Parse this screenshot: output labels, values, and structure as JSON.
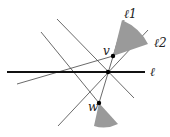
{
  "diagram": {
    "type": "geometry",
    "labels": {
      "l1": "ℓ1",
      "l2": "ℓ2",
      "l": "ℓ",
      "v": "v",
      "w": "w"
    },
    "points": {
      "v": [
        113,
        56
      ],
      "center": [
        108,
        72
      ],
      "w": [
        99,
        103
      ]
    },
    "colors": {
      "line": "#333333",
      "thick_line": "#111111",
      "cone_fill": "#9a9a9a",
      "point": "#000000"
    }
  }
}
